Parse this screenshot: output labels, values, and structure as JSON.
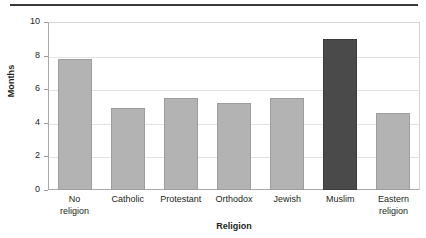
{
  "chart_data": {
    "type": "bar",
    "title": "",
    "xlabel": "Religion",
    "ylabel": "Months",
    "categories": [
      "No religion",
      "Catholic",
      "Protestant",
      "Orthodox",
      "Jewish",
      "Muslim",
      "Eastern religion"
    ],
    "values": [
      7.8,
      4.9,
      5.5,
      5.2,
      5.5,
      9.0,
      4.6
    ],
    "ylim": [
      0,
      10
    ],
    "yticks": [
      0,
      2,
      4,
      6,
      8,
      10
    ],
    "ytick_labels": [
      "0",
      "2",
      "4",
      "6",
      "8",
      "10"
    ],
    "grid": true,
    "legend": "none",
    "highlight_category": "Muslim",
    "colors": {
      "bar": "#b3b3b3",
      "bar_border": "#9d9d9d",
      "bar_highlight": "#4a4a4a",
      "bar_highlight_border": "#3c3c3c",
      "axis": "#a9a9a9",
      "grid": "#e2e2e2",
      "text": "#231f20",
      "rule": "#3a3a3a"
    }
  },
  "axis": {
    "y_title": "Months",
    "x_title": "Religion"
  },
  "xtick_lines": [
    [
      "No",
      "religion"
    ],
    [
      "Catholic"
    ],
    [
      "Protestant"
    ],
    [
      "Orthodox"
    ],
    [
      "Jewish"
    ],
    [
      "Muslim"
    ],
    [
      "Eastern",
      "religion"
    ]
  ]
}
